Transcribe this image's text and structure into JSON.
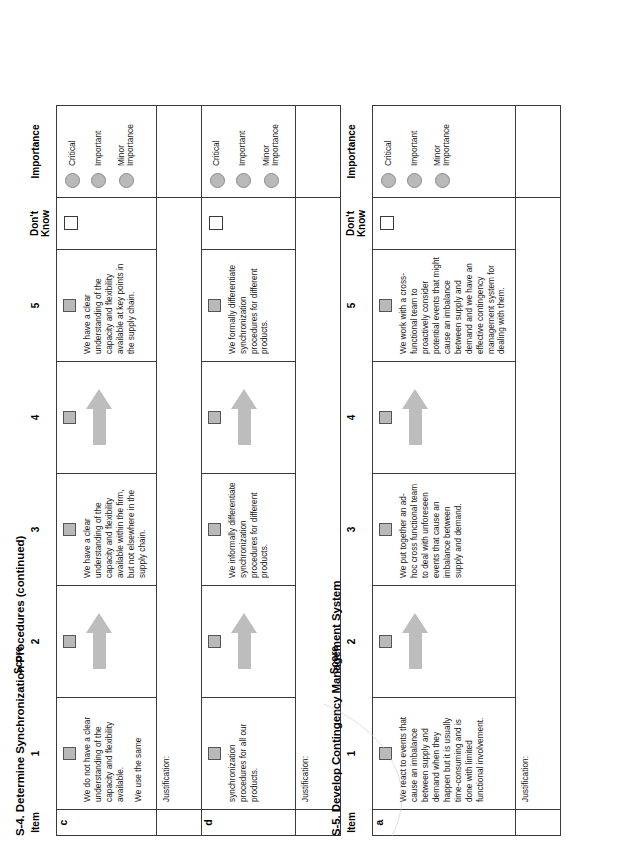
{
  "document": {
    "page_type": "assessment-worksheet",
    "orientation": "landscape-rotated-90ccw"
  },
  "columns": {
    "item": "Item",
    "score_group": "Score",
    "score_1": "1",
    "score_2": "2",
    "score_3": "3",
    "score_4": "4",
    "score_5": "5",
    "dont_know_line1": "Don't",
    "dont_know_line2": "Know",
    "importance": "Importance"
  },
  "importance_options": [
    {
      "label_line1": "Critical",
      "label_line2": ""
    },
    {
      "label_line1": "Important",
      "label_line2": ""
    },
    {
      "label_line1": "Minor",
      "label_line2": "Importance"
    }
  ],
  "justification_label": "Justification:",
  "sections": [
    {
      "id": "s4",
      "title": "S-4. Determine Synchronization Procedures (continued)",
      "score_label": "Score",
      "rows": [
        {
          "letter": "c",
          "desc_1_a": "We do not have a clear understanding of the capacity and flexibility available.",
          "desc_1_b": "We use the same",
          "desc_3": "We have a clear understanding of the capacity and flexibility available within the firm, but not elsewhere in the supply chain.",
          "desc_5": "We have a clear understanding of the capacity and flexibility available at key points in the supply chain."
        },
        {
          "letter": "d",
          "desc_1_a": "synchronization procedures for all our products.",
          "desc_1_b": "",
          "desc_3": "We informally differentiate synchronization procedures for different products.",
          "desc_5": "We formally differentiate synchronization procedures for different products."
        }
      ]
    },
    {
      "id": "s5",
      "title": "S-5. Develop Contingency Management System",
      "score_label": "Score",
      "rows": [
        {
          "letter": "a",
          "desc_1_a": "We react to events that cause an imbalance between supply and demand when they happen but it is usually time-consuming and is done with limited functional involvement.",
          "desc_1_b": "",
          "desc_3": "We put together an ad-hoc cross functional team to deal with unforeseen events that cause an imbalance between supply and demand.",
          "desc_5": "We work with a cross-functional team to proactively consider potential events that might cause an imbalance between supply and demand and we have an effective contingency management system for dealing with them."
        }
      ]
    }
  ],
  "colors": {
    "checkbox_filled": "#b9b9b9",
    "checkbox_empty": "#ffffff",
    "radio": "#b9b9b9",
    "arrow": "#bdbdbd",
    "border": "#3a3a3a"
  }
}
